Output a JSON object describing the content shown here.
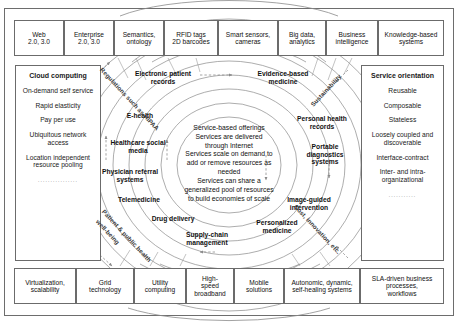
{
  "diagram": {
    "colors": {
      "border": "#6b6b6b",
      "text": "#111111",
      "arc": "#8a8a8a",
      "rotated_label": "#3b3b3b"
    }
  },
  "top_row": {
    "items": [
      {
        "lines": [
          "Web",
          "2.0, 3.0"
        ]
      },
      {
        "lines": [
          "Enterprise",
          "2.0, 3.0"
        ]
      },
      {
        "lines": [
          "Semantics,",
          "ontology"
        ]
      },
      {
        "lines": [
          "RFID tags",
          "2D barcodes"
        ]
      },
      {
        "lines": [
          "Smart sensors,",
          "cameras"
        ]
      },
      {
        "lines": [
          "Big data,",
          "analytics"
        ]
      },
      {
        "lines": [
          "Business",
          "intelligence"
        ]
      },
      {
        "lines": [
          "Knowledge-based",
          "systems"
        ]
      }
    ]
  },
  "bottom_row": {
    "items": [
      {
        "lines": [
          "Virtualization,",
          "scalability"
        ]
      },
      {
        "lines": [
          "Grid",
          "technology"
        ]
      },
      {
        "lines": [
          "Utility",
          "computing"
        ]
      },
      {
        "lines": [
          "High-",
          "speed",
          "broadband"
        ]
      },
      {
        "lines": [
          "Mobile",
          "solutions"
        ]
      },
      {
        "lines": [
          "Autonomic, dynamic,",
          "self-healing systems"
        ]
      },
      {
        "lines": [
          "SLA-driven business",
          "processes,",
          "workflows"
        ]
      }
    ]
  },
  "left_panel": {
    "heading": "Cloud computing",
    "items": [
      "On-demand self service",
      "Rapid elasticity",
      "Pay per use",
      "Ubiquitous network access",
      "Location independent resource pooling"
    ],
    "dots": "................"
  },
  "right_panel": {
    "heading": "Service orientation",
    "items": [
      "Reusable",
      "Composable",
      "Stateless",
      "Loosely coupled and discoverable",
      "Interface-contract",
      "Inter- and intra-organizational"
    ],
    "dots": "..........."
  },
  "center": {
    "lines": [
      "Service-based offerings",
      "Services are delivered",
      "through Internet",
      "Services scale on demand to",
      "add or remove resources as",
      "needed",
      "Services can share a",
      "generalized pool of resources",
      "to build economies of scale"
    ]
  },
  "arc_labels": {
    "left": [
      {
        "lines": [
          "Electronic patient",
          "records"
        ]
      },
      {
        "lines": [
          "E-health"
        ]
      },
      {
        "lines": [
          "Healthcare social",
          "media"
        ]
      },
      {
        "lines": [
          "Physician referral",
          "systems"
        ]
      },
      {
        "lines": [
          "Telemedicine"
        ]
      },
      {
        "lines": [
          "Drug delivery"
        ]
      },
      {
        "lines": [
          "Supply-chain",
          "management"
        ]
      }
    ],
    "right": [
      {
        "lines": [
          "Evidence-based",
          "medicine"
        ]
      },
      {
        "lines": [
          "Personal health",
          "records"
        ]
      },
      {
        "lines": [
          "Portable",
          "diagnostics",
          "systems"
        ]
      },
      {
        "lines": [
          "Image-guided",
          "intervention"
        ]
      },
      {
        "lines": [
          "Personalized",
          "medicine"
        ]
      }
    ]
  },
  "rotated_labels": {
    "top_left": "Regulations such as HIPAA",
    "bottom_left_line1": "Patient & public health",
    "bottom_left_line2": "well-being",
    "top_right": "Sustainability",
    "bottom_right": "Cost, innovation, etc."
  }
}
